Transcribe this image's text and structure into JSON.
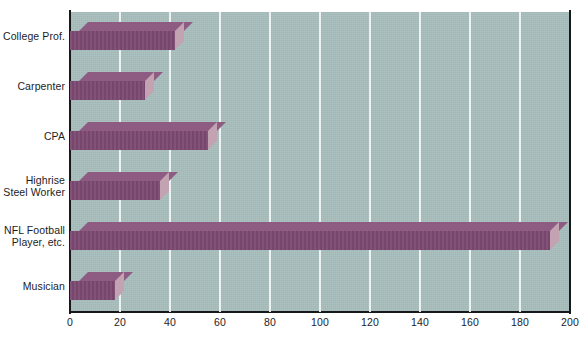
{
  "scan_remnant": "",
  "chart_data": {
    "type": "bar",
    "orientation": "horizontal",
    "title": "",
    "subtitle": "",
    "xlabel": "",
    "ylabel": "",
    "categories": [
      "College Prof.",
      "Carpenter",
      "CPA",
      "Highrise Steel Worker",
      "NFL Football Player, etc.",
      "Musician"
    ],
    "category_lines": [
      [
        "College Prof."
      ],
      [
        "Carpenter"
      ],
      [
        "CPA"
      ],
      [
        "Highrise",
        "Steel Worker"
      ],
      [
        "NFL Football",
        "Player, etc."
      ],
      [
        "Musician"
      ]
    ],
    "values": [
      42,
      30,
      55,
      36,
      192,
      18
    ],
    "xlim": [
      0,
      200
    ],
    "xticks": [
      0,
      20,
      40,
      60,
      80,
      100,
      120,
      140,
      160,
      180,
      200
    ],
    "xtick_labels": [
      "0",
      "20",
      "40",
      "60",
      "80",
      "100",
      "120",
      "140",
      "160",
      "180",
      "200"
    ],
    "grid": true,
    "grid_axis": "x",
    "legend": false,
    "style_3d": true
  },
  "colors": {
    "plot_background": "#a9bfbd",
    "gridline": "#f2f6f5",
    "bar_front": "#7d4a72",
    "bar_top": "#8e5c82",
    "bar_cap": "#c3a3b1",
    "axis": "#17181a",
    "text": "#1b1c1e",
    "page_background": "#ffffff"
  }
}
